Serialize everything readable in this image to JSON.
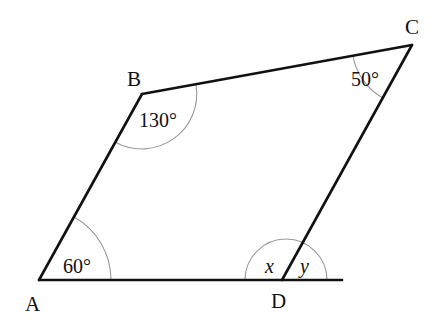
{
  "diagram": {
    "type": "quadrilateral-with-extended-side",
    "vertices": {
      "A": {
        "label": "A"
      },
      "B": {
        "label": "B"
      },
      "C": {
        "label": "C"
      },
      "D": {
        "label": "D"
      }
    },
    "angles": {
      "A": {
        "label": "60°"
      },
      "B": {
        "label": "130°"
      },
      "C": {
        "label": "50°"
      },
      "D_interior": {
        "label": "x"
      },
      "D_exterior": {
        "label": "y"
      }
    },
    "colors": {
      "stroke": "#111111",
      "arc": "#9a9a9a",
      "background": "#ffffff"
    }
  }
}
